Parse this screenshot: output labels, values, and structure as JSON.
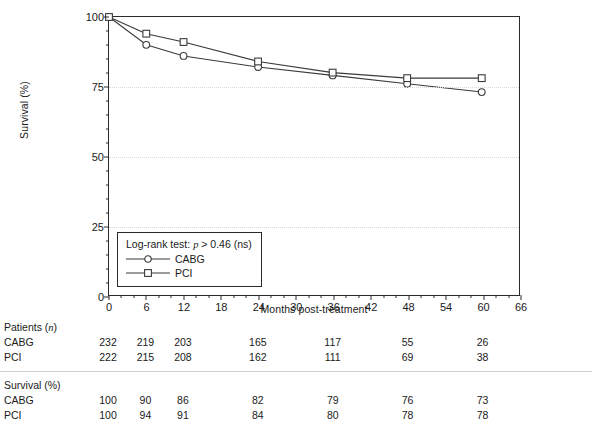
{
  "chart_data": {
    "type": "line",
    "title": "",
    "xlabel": "Months post-treatment",
    "ylabel": "Survival (%)",
    "xlim": [
      0,
      66
    ],
    "ylim": [
      0,
      100
    ],
    "xticks": [
      0,
      6,
      12,
      18,
      24,
      30,
      36,
      42,
      48,
      54,
      60,
      66
    ],
    "yticks": [
      0,
      25,
      50,
      75,
      100
    ],
    "x_minor_step": 2,
    "y_minor_step": 5,
    "grid": "horizontal-dotted",
    "legend_position": "inside-lower-left",
    "annotation": "Log-rank test: p > 0.46 (ns)",
    "x": [
      0,
      6,
      12,
      24,
      36,
      48,
      60
    ],
    "series": [
      {
        "name": "CABG",
        "marker": "open-circle",
        "values": [
          100,
          90,
          86,
          82,
          79,
          76,
          73
        ]
      },
      {
        "name": "PCI",
        "marker": "open-square",
        "values": [
          100,
          94,
          91,
          84,
          80,
          78,
          78
        ]
      }
    ]
  },
  "axes": {
    "ylabel": "Survival (%)",
    "xlabel": "Months post-treatment",
    "ytick_labels": [
      "0",
      "25",
      "50",
      "75",
      "100"
    ],
    "xtick_labels": [
      "0",
      "6",
      "12",
      "18",
      "24",
      "30",
      "36",
      "42",
      "48",
      "54",
      "60",
      "66"
    ]
  },
  "legend": {
    "test_prefix": "Log-rank test: ",
    "test_italic": "p",
    "test_suffix": " > 0.46 (ns)",
    "entries": [
      {
        "label": "CABG",
        "marker": "open-circle"
      },
      {
        "label": "PCI",
        "marker": "open-square"
      }
    ]
  },
  "risk_table": {
    "columns": [
      0,
      6,
      12,
      24,
      36,
      48,
      60
    ],
    "sections": [
      {
        "heading_prefix": "Patients (",
        "heading_italic": "n",
        "heading_suffix": ")",
        "rows": [
          {
            "label": "CABG",
            "values": [
              "232",
              "219",
              "203",
              "165",
              "117",
              "55",
              "26"
            ]
          },
          {
            "label": "PCI",
            "values": [
              "222",
              "215",
              "208",
              "162",
              "111",
              "69",
              "38"
            ]
          }
        ]
      },
      {
        "heading_prefix": "Survival (%)",
        "heading_italic": "",
        "heading_suffix": "",
        "rows": [
          {
            "label": "CABG",
            "values": [
              "100",
              "90",
              "86",
              "82",
              "79",
              "76",
              "73"
            ]
          },
          {
            "label": "PCI",
            "values": [
              "100",
              "94",
              "91",
              "84",
              "80",
              "78",
              "78"
            ]
          }
        ]
      }
    ]
  },
  "colors": {
    "axis": "#2b2b2b",
    "series": "#3a3a3a",
    "grid": "#d8d8d8",
    "text": "#1a1a1a",
    "marker_fill": "#ffffff"
  }
}
